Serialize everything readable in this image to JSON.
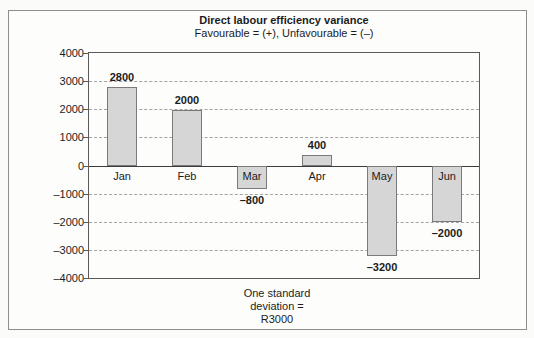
{
  "figure": {
    "title": "Direct labour efficiency variance",
    "subtitle": "Favourable = (+), Unfavourable = (–)"
  },
  "note": {
    "lines": [
      "One standard",
      "deviation =",
      "R3000"
    ]
  },
  "chart_data": {
    "type": "bar",
    "categories": [
      "Jan",
      "Feb",
      "Mar",
      "Apr",
      "May",
      "Jun"
    ],
    "values": [
      2800,
      2000,
      -800,
      400,
      -3200,
      -2000
    ],
    "value_labels": [
      "2800",
      "2000",
      "–800",
      "400",
      "–3200",
      "–2000"
    ],
    "title": "Direct labour efficiency variance",
    "subtitle": "Favourable = (+), Unfavourable = (–)",
    "xlabel": "",
    "ylabel": "",
    "ylim": [
      -4000,
      4000
    ],
    "ytick_step": 1000,
    "ytick_labels": [
      "4000",
      "3000",
      "2000",
      "1000",
      "0",
      "–1000",
      "–2000",
      "–3000",
      "–4000"
    ],
    "grid": "horizontal-dashed",
    "legend": "none",
    "annotation": "One standard deviation = R3000",
    "colors": {
      "bar_fill": "#d6d6d6",
      "bar_border": "#7a7a7a",
      "gridline": "#a3a3a3",
      "axis": "#3c3c3c",
      "text": "#1c1c1c"
    }
  }
}
